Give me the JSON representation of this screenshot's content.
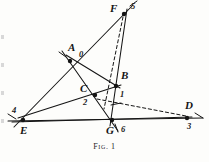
{
  "figure": {
    "caption": "Fig. 1",
    "background_color": "#fdfdfb",
    "ink_color": "#141414",
    "points": [
      {
        "id": "A",
        "letter": "A",
        "number": "0",
        "x": 70,
        "y": 61,
        "letter_dx": -2,
        "letter_dy": -19,
        "number_dx": 9,
        "number_dy": -11
      },
      {
        "id": "B",
        "letter": "B",
        "number": "1",
        "x": 116,
        "y": 86,
        "letter_dx": 5,
        "letter_dy": -16,
        "number_dx": 4,
        "number_dy": 4
      },
      {
        "id": "C",
        "letter": "C",
        "number": "2",
        "x": 95,
        "y": 95,
        "letter_dx": -15,
        "letter_dy": -12,
        "number_dx": -12,
        "number_dy": 3
      },
      {
        "id": "D",
        "letter": "D",
        "number": "3",
        "x": 187,
        "y": 118,
        "letter_dx": -2,
        "letter_dy": -18,
        "number_dx": 0,
        "number_dy": 4
      },
      {
        "id": "E",
        "letter": "E",
        "number": "4",
        "x": 23,
        "y": 120,
        "letter_dx": -3,
        "letter_dy": 5,
        "number_dx": -11,
        "number_dy": -14
      },
      {
        "id": "F",
        "letter": "F",
        "number": "5",
        "x": 124,
        "y": 14,
        "letter_dx": -14,
        "letter_dy": -11,
        "number_dx": 7,
        "number_dy": -12
      },
      {
        "id": "G",
        "letter": "G",
        "number": "6",
        "x": 112,
        "y": 120,
        "letter_dx": -6,
        "letter_dy": 5,
        "number_dx": 9,
        "number_dy": 5
      }
    ],
    "solid_segments": [
      {
        "name": "line-E-F-through-A",
        "x1": 14,
        "y1": 127,
        "x2": 133,
        "y2": 5
      },
      {
        "name": "line-E-D-baseline",
        "x1": 8,
        "y1": 121,
        "x2": 203,
        "y2": 118
      },
      {
        "name": "line-E-B-to-D",
        "x1": 12,
        "y1": 122,
        "x2": 192,
        "y2": 117
      },
      {
        "name": "line-A-G-extended",
        "x1": 62,
        "y1": 51,
        "x2": 118,
        "y2": 131
      },
      {
        "name": "line-F-G",
        "x1": 127,
        "y1": 9,
        "x2": 110,
        "y2": 126
      },
      {
        "name": "line-A-C-B-segment",
        "x1": 66,
        "y1": 55,
        "x2": 120,
        "y2": 88
      },
      {
        "name": "line-E-through-C-to-B",
        "x1": 18,
        "y1": 118,
        "x2": 121,
        "y2": 85
      }
    ],
    "dashed_segments": [
      {
        "name": "dashed-F-to-C-G",
        "x1": 123,
        "y1": 17,
        "x2": 104,
        "y2": 109
      },
      {
        "name": "dashed-C-to-D",
        "x1": 97,
        "y1": 99,
        "x2": 186,
        "y2": 116
      }
    ],
    "tick_marks": [
      {
        "name": "tick-A-upper-left",
        "x1": 59,
        "y1": 52,
        "x2": 66,
        "y2": 57
      },
      {
        "name": "tick-F-upper-right",
        "x1": 130,
        "y1": 6,
        "x2": 137,
        "y2": 1
      },
      {
        "name": "tick-E-left",
        "x1": 8,
        "y1": 114,
        "x2": 16,
        "y2": 119
      },
      {
        "name": "tick-D-right",
        "x1": 195,
        "y1": 113,
        "x2": 203,
        "y2": 118
      },
      {
        "name": "tick-G-below",
        "x1": 115,
        "y1": 124,
        "x2": 118,
        "y2": 132
      },
      {
        "name": "tick-B-right-short",
        "x1": 111,
        "y1": 105,
        "x2": 121,
        "y2": 103
      }
    ],
    "page_marks": [
      {
        "name": "page-edge-mark-1",
        "y": 35
      },
      {
        "name": "page-edge-mark-2",
        "y": 63
      },
      {
        "name": "page-edge-mark-3",
        "y": 91
      },
      {
        "name": "page-edge-mark-4",
        "y": 119
      }
    ]
  }
}
